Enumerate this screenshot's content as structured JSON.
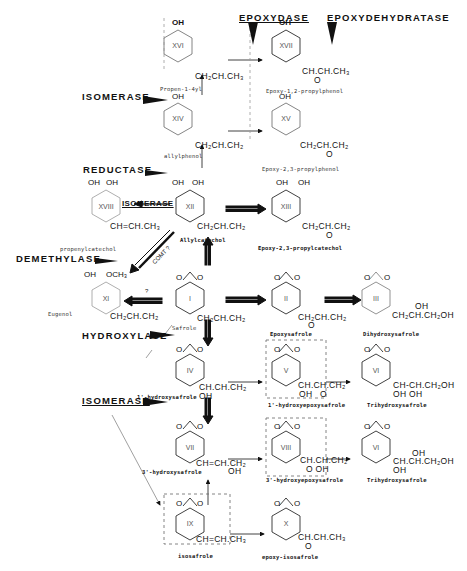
{
  "enzymes": {
    "epoxydase": "EPOXYDASE",
    "epoxydehydratase": "EPOXYDEHYDRATASE",
    "isomerase_top": "ISOMERASE",
    "reductase": "REDUCTASE",
    "isomerase_mid": "ISOMERASE",
    "demethylase": "DEMETHYLASE",
    "hydroxylase": "HYDROXYLASE",
    "isomerase_bottom": "ISOMERASE"
  },
  "compounds": {
    "XVI": {
      "roman": "XVI",
      "substituent": "OH",
      "chain": "CH₂CH.CH₃",
      "name": "Propen-1-4yl"
    },
    "XVII": {
      "roman": "XVII",
      "substituent": "OH",
      "chain": "CH.CH.CH₃",
      "epoxide": "O",
      "name": "Epoxy-1,2-propylphenol"
    },
    "XIV": {
      "roman": "XIV",
      "substituent": "OH",
      "chain": "CH₂CH.CH₂",
      "name": "allylphenol"
    },
    "XV": {
      "roman": "XV",
      "substituent": "OH",
      "chain": "CH₂CH.CH₂",
      "epoxide": "O",
      "name": "Epoxy-2,3-propylphenol"
    },
    "XVIII": {
      "roman": "XVIII",
      "substituents": [
        "OH",
        "OH"
      ],
      "chain": "CH=CH.CH₃",
      "name": "propenylcatechol"
    },
    "XII": {
      "roman": "XII",
      "substituents": [
        "OH",
        "OH"
      ],
      "chain": "CH₂CH.CH₂",
      "name": "Allylcatechol"
    },
    "XIII": {
      "roman": "XIII",
      "substituents": [
        "OH",
        "OH"
      ],
      "chain": "CH₂CH.CH₂",
      "epoxide": "O",
      "name": "Epoxy-2,3-propylcatechol"
    },
    "XI": {
      "roman": "XI",
      "substituents": [
        "OH",
        "OCH₃"
      ],
      "chain": "CH₂CH.CH₂",
      "name": "Eugenol"
    },
    "I": {
      "roman": "I",
      "ring_o": [
        "O",
        "O"
      ],
      "chain": "CH₂CH.CH₂",
      "name": "Safrole"
    },
    "II": {
      "roman": "II",
      "ring_o": [
        "O",
        "O"
      ],
      "chain": "CH₂CH.CH₂",
      "epoxide": "O",
      "name": "Epoxysafrole"
    },
    "III": {
      "roman": "III",
      "ring_o": [
        "O",
        "O"
      ],
      "chain": "CH₂CH.CH₂OH",
      "oh": "OH",
      "name": "Dihydroxysafrole"
    },
    "IV": {
      "roman": "IV",
      "ring_o": [
        "O",
        "O"
      ],
      "chain": "CH.CH.CH₂",
      "oh": "OH",
      "name": "1'-hydroxysafrole"
    },
    "V": {
      "roman": "V",
      "ring_o": [
        "O",
        "O"
      ],
      "chain": "CH.CH.CH₂",
      "oh": "OH",
      "epoxide": "O",
      "name": "1'-hydroxyepoxysafrole"
    },
    "VI_top": {
      "roman": "VI",
      "ring_o": [
        "O",
        "O"
      ],
      "chain": "CH-CH.CH₂OH",
      "oh": "OH  OH",
      "name": "Trihydroxysafrole"
    },
    "VII": {
      "roman": "VII",
      "ring_o": [
        "O",
        "O"
      ],
      "chain": "CH=CH.CH₂",
      "oh": "OH",
      "name": "3'-hydroxysafrole"
    },
    "VIII": {
      "roman": "VIII",
      "ring_o": [
        "O",
        "O"
      ],
      "chain": "CH.CH.CH₂",
      "oh": "O    OH",
      "name": "3'-hydroxyepoxysafrole"
    },
    "VI_bottom": {
      "roman": "VI",
      "ring_o": [
        "O",
        "O"
      ],
      "chain": "CH.CH.CH₂OH",
      "oh_top": "OH",
      "oh": "OH",
      "name": "Trihydroxysafrole"
    },
    "IX": {
      "roman": "IX",
      "ring_o": [
        "O",
        "O"
      ],
      "chain": "CH=CH.CH₃",
      "name": "isosafrole"
    },
    "X": {
      "roman": "X",
      "ring_o": [
        "O",
        "O"
      ],
      "chain": "CH.CH.CH₃",
      "epoxide": "O",
      "name": "epoxy-isosafrole"
    }
  },
  "annotations": {
    "comt": "COMT ?",
    "question": "?"
  }
}
